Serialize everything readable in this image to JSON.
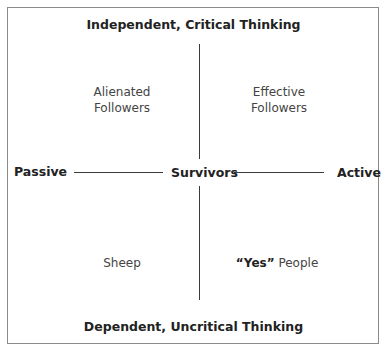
{
  "diagram": {
    "top_axis": "Independent, Critical Thinking",
    "bottom_axis": "Dependent, Uncritical Thinking",
    "left_axis": "Passive",
    "right_axis": "Active",
    "center": "Survivors",
    "quadrants": {
      "top_left": [
        "Alienated",
        "Followers"
      ],
      "top_right": [
        "Effective",
        "Followers"
      ],
      "bottom_left": "Sheep",
      "bottom_right": {
        "bold": "“Yes”",
        "rest": " People"
      }
    }
  }
}
